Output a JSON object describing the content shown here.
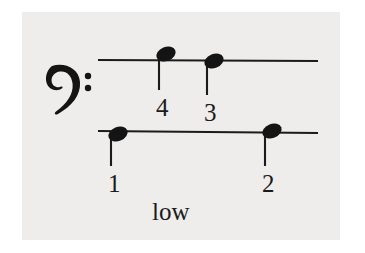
{
  "figure": {
    "kind": "music-notation-diagram",
    "background_color": "#ffffff",
    "plate_color": "#eeedeb",
    "ink_color": "#1b1b1b",
    "caption": "low",
    "clef": {
      "name": "bass-clef",
      "glyph": "𝄢",
      "x": 62,
      "y": 88
    },
    "staff_lines": [
      {
        "name": "upper-ledger-line",
        "x1": 98,
        "y1": 60,
        "x2": 318,
        "y2": 61
      },
      {
        "name": "lower-ledger-line",
        "x1": 98,
        "y1": 131,
        "x2": 318,
        "y2": 133
      }
    ],
    "notes": [
      {
        "label": "1",
        "line": "lower-ledger-line",
        "head_cx": 118,
        "head_cy": 134,
        "head_rx": 10,
        "head_ry": 7,
        "head_rotation": -22,
        "stem_x": 111,
        "stem_y1": 136,
        "stem_y2": 166,
        "label_x": 108,
        "label_y": 171
      },
      {
        "label": "2",
        "line": "lower-ledger-line",
        "head_cx": 272,
        "head_cy": 131,
        "head_rx": 10,
        "head_ry": 7,
        "head_rotation": -22,
        "stem_x": 265,
        "stem_y1": 133,
        "stem_y2": 166,
        "label_x": 262,
        "label_y": 171
      },
      {
        "label": "3",
        "line": "upper-ledger-line",
        "head_cx": 214,
        "head_cy": 61,
        "head_rx": 10,
        "head_ry": 7,
        "head_rotation": -22,
        "stem_x": 207,
        "stem_y1": 62,
        "stem_y2": 95,
        "label_x": 204,
        "label_y": 100
      },
      {
        "label": "4",
        "line": "upper-ledger-line",
        "head_cx": 166,
        "head_cy": 54,
        "head_rx": 10,
        "head_ry": 7,
        "head_rotation": -22,
        "stem_x": 159,
        "stem_y1": 56,
        "stem_y2": 90,
        "label_x": 156,
        "label_y": 95
      }
    ],
    "caption_position": {
      "x": 152,
      "y": 199
    }
  }
}
